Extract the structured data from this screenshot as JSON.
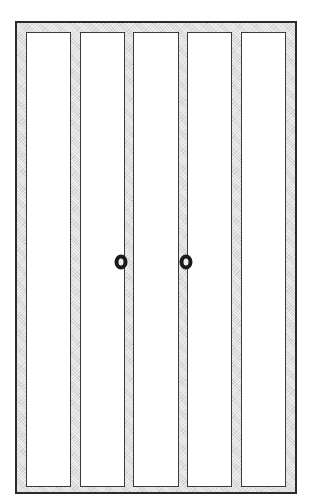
{
  "figure": {
    "canvas": {
      "width": 314,
      "height": 503,
      "background": "#ffffff"
    },
    "frame": {
      "name": "door-frame",
      "outline_color": "#2b2b2b",
      "fill_color": "#dcdcdc",
      "outline_width_px": 2,
      "x": 15,
      "y": 21,
      "width": 282,
      "height": 473
    },
    "panels": [
      {
        "id": "panel-1",
        "label": "",
        "fill": "#ffffff",
        "outline": "#3a3a3a"
      },
      {
        "id": "panel-2",
        "label": "",
        "fill": "#ffffff",
        "outline": "#3a3a3a"
      },
      {
        "id": "panel-3",
        "label": "",
        "fill": "#ffffff",
        "outline": "#3a3a3a"
      },
      {
        "id": "panel-4",
        "label": "",
        "fill": "#ffffff",
        "outline": "#3a3a3a"
      },
      {
        "id": "panel-5",
        "label": "",
        "fill": "#ffffff",
        "outline": "#3a3a3a"
      }
    ],
    "knobs": [
      {
        "id": "knob-left",
        "label": "",
        "x": 121,
        "y": 262,
        "color": "#1a1a1a"
      },
      {
        "id": "knob-right",
        "label": "",
        "x": 186,
        "y": 262,
        "color": "#1a1a1a"
      }
    ],
    "labels": [],
    "annotations": []
  }
}
